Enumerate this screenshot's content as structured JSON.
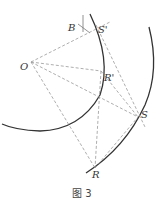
{
  "figure": {
    "caption": "图 3",
    "points": {
      "B": {
        "label": "B",
        "x": 83,
        "y": 28
      },
      "S_prime": {
        "label": "S'",
        "x": 96,
        "y": 25
      },
      "O": {
        "label": "O",
        "x": 31,
        "y": 62
      },
      "R_prime": {
        "label": "R'",
        "x": 101,
        "y": 71
      },
      "S": {
        "label": "S",
        "x": 138,
        "y": 117
      },
      "R": {
        "label": "R",
        "x": 95,
        "y": 168
      }
    },
    "arcs": [
      {
        "name": "inner-arc",
        "description": "arc passing through S' and R'"
      },
      {
        "name": "outer-arc",
        "description": "arc passing through S and R"
      }
    ],
    "colors": {
      "arc": "#333333",
      "construction": "#999999"
    }
  }
}
